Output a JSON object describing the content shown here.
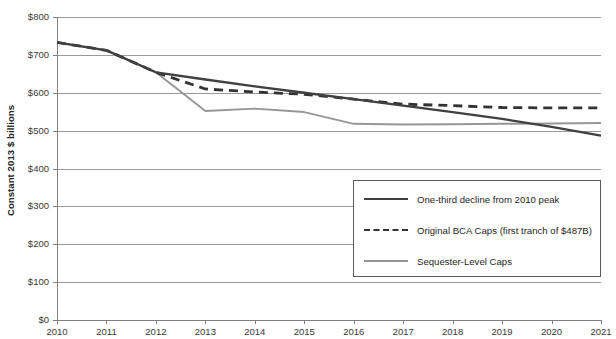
{
  "chart_data": {
    "type": "line",
    "title": "",
    "xlabel": "",
    "ylabel": "Constant 2013 $ billions",
    "x": [
      2010,
      2011,
      2012,
      2013,
      2014,
      2015,
      2016,
      2017,
      2018,
      2019,
      2020,
      2021
    ],
    "xtick_labels": [
      "2010",
      "2011",
      "2012",
      "2013",
      "2014",
      "2015",
      "2016",
      "2017",
      "2018",
      "2019",
      "2020",
      "2021"
    ],
    "ytick_labels": [
      "$800",
      "$700",
      "$600",
      "$500",
      "$400",
      "$300",
      "$200",
      "$100",
      "$0"
    ],
    "ytick_values": [
      800,
      700,
      600,
      500,
      400,
      300,
      200,
      100,
      0
    ],
    "ylim": [
      0,
      800
    ],
    "xlim": [
      2010,
      2021
    ],
    "grid": "horizontal",
    "legend_position": "center-right-inside",
    "series": [
      {
        "name": "One-third decline from 2010 peak",
        "style": "solid",
        "color": "#404040",
        "values": [
          733,
          712,
          654,
          635,
          617,
          600,
          583,
          566,
          549,
          531,
          510,
          487
        ]
      },
      {
        "name": "Original BCA Caps (first tranch of $487B)",
        "style": "dashed",
        "color": "#333333",
        "values": [
          733,
          712,
          654,
          610,
          602,
          596,
          583,
          570,
          566,
          561,
          560,
          560
        ]
      },
      {
        "name": "Sequester-Level Caps",
        "style": "solid",
        "color": "#969696",
        "values": [
          733,
          712,
          654,
          552,
          558,
          549,
          518,
          516,
          517,
          518,
          519,
          520
        ]
      }
    ]
  },
  "legend": {
    "entries": [
      {
        "label": "One-third decline from 2010 peak"
      },
      {
        "label": "Original BCA Caps (first tranch of $487B)"
      },
      {
        "label": "Sequester-Level Caps"
      }
    ]
  },
  "colors": {
    "axis": "#7f7f7f",
    "grid": "#9a9a9a",
    "text": "#3a3a3a",
    "background": "#ffffff",
    "legend_border": "#5a5a5a"
  }
}
